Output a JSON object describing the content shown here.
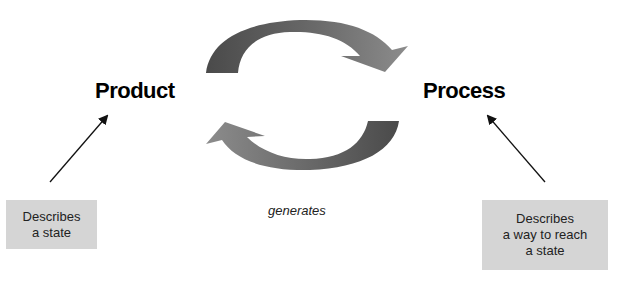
{
  "diagram": {
    "nodes": [
      {
        "id": "product",
        "label": "Product"
      },
      {
        "id": "process",
        "label": "Process"
      }
    ],
    "cycle_edge_label": "generates",
    "notes": [
      {
        "target": "product",
        "lines": [
          "Describes",
          "a state"
        ]
      },
      {
        "target": "process",
        "lines": [
          "Describes",
          "a way to reach",
          "a state"
        ]
      }
    ],
    "colors": {
      "arrow_dark": "#4a4a4a",
      "arrow_light": "#8c8c8c",
      "note_bg": "#d5d5d5",
      "text": "#000000"
    }
  }
}
